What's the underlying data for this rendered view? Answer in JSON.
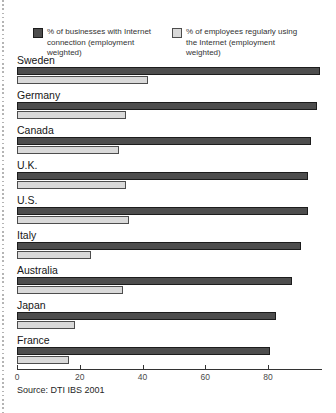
{
  "legend": {
    "items": [
      {
        "line1": "% of businesses with Internet",
        "line2": "connection (employment weighted)"
      },
      {
        "line1": "% of employees regularly using",
        "line2": "the Internet (employment weighted)"
      }
    ]
  },
  "source": "Source: DTI IBS 2001",
  "colors": {
    "businesses_bar": "#4d4d4d",
    "employees_bar": "#d9d9d9",
    "axis": "#333333"
  },
  "chart_data": {
    "type": "bar",
    "orientation": "horizontal",
    "title": "",
    "xlabel": "",
    "ylabel": "",
    "categories": [
      "Sweden",
      "Germany",
      "Canada",
      "U.K.",
      "U.S.",
      "Italy",
      "Australia",
      "Japan",
      "France"
    ],
    "series": [
      {
        "name": "% of businesses with Internet connection (employment weighted)",
        "color": "#4d4d4d",
        "values": [
          96,
          95,
          93,
          92,
          92,
          90,
          87,
          82,
          80
        ]
      },
      {
        "name": "% of employees regularly using the Internet (employment weighted)",
        "color": "#d9d9d9",
        "values": [
          41,
          34,
          32,
          34,
          35,
          23,
          33,
          18,
          16
        ]
      }
    ],
    "x_ticks": [
      0,
      20,
      40,
      60,
      80
    ],
    "xlim": [
      0,
      97.2
    ],
    "grid": false,
    "legend_position": "top",
    "source": "Source: DTI IBS 2001"
  }
}
